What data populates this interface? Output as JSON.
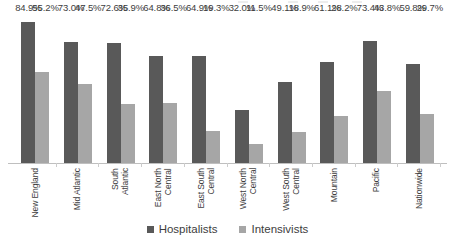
{
  "chart_data": {
    "type": "bar",
    "title": "",
    "subtitle": "",
    "xlabel": "",
    "ylabel": "",
    "ylim": [
      0,
      90
    ],
    "grid": false,
    "legend_position": "bottom",
    "value_suffix": "%",
    "categories": [
      "New England",
      "Mid Atlantic",
      "South Atlantic",
      "East North\nCentral",
      "East South\nCentral",
      "West North\nCentral",
      "West South\nCentral",
      "Mountain",
      "Pacific",
      "Nationwide"
    ],
    "series": [
      {
        "name": "Hospitalists",
        "color": "#595959",
        "values": [
          84.9,
          73.0,
          72.6,
          64.8,
          64.9,
          32.0,
          49.1,
          61.1,
          73.4,
          59.8
        ],
        "labels": [
          "84.9%",
          "73.0%",
          "72.6%",
          "64.8%",
          "64.9%",
          "32.0%",
          "49.1%",
          "61.1%",
          "73.4%",
          "59.8%"
        ]
      },
      {
        "name": "Intensivists",
        "color": "#a6a6a6",
        "values": [
          55.2,
          47.5,
          35.9,
          36.5,
          19.3,
          11.5,
          18.9,
          28.2,
          43.8,
          29.7
        ],
        "labels": [
          "55.2%",
          "47.5%",
          "35.9%",
          "36.5%",
          "19.3%",
          "11.5%",
          "18.9%",
          "28.2%",
          "43.8%",
          "29.7%"
        ]
      }
    ]
  },
  "legend": {
    "items": [
      {
        "label": "Hospitalists",
        "color": "#595959"
      },
      {
        "label": "Intensivists",
        "color": "#a6a6a6"
      }
    ]
  },
  "colors": {
    "series_hospitalists": "#595959",
    "series_intensivists": "#a6a6a6",
    "axis": "#bfbfbf",
    "text": "#3d3d3d",
    "background": "#ffffff"
  }
}
